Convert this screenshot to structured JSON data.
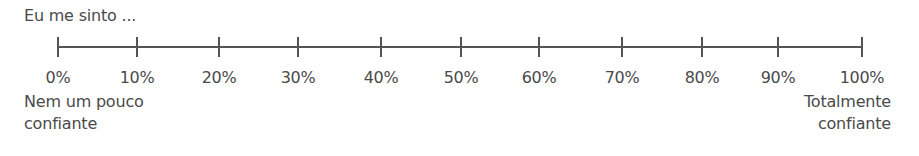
{
  "prompt": "Eu me sinto ...",
  "scale": {
    "ticks": [
      {
        "label": "0%",
        "x": 58
      },
      {
        "label": "10%",
        "x": 137
      },
      {
        "label": "20%",
        "x": 219
      },
      {
        "label": "30%",
        "x": 298
      },
      {
        "label": "40%",
        "x": 381
      },
      {
        "label": "50%",
        "x": 461
      },
      {
        "label": "60%",
        "x": 539
      },
      {
        "label": "70%",
        "x": 622
      },
      {
        "label": "80%",
        "x": 702
      },
      {
        "label": "90%",
        "x": 778
      },
      {
        "label": "100%",
        "x": 862
      }
    ],
    "anchor_left": {
      "line1": "Nem um pouco",
      "line2": "confiante"
    },
    "anchor_right": {
      "line1": "Totalmente",
      "line2": "confiante"
    }
  }
}
